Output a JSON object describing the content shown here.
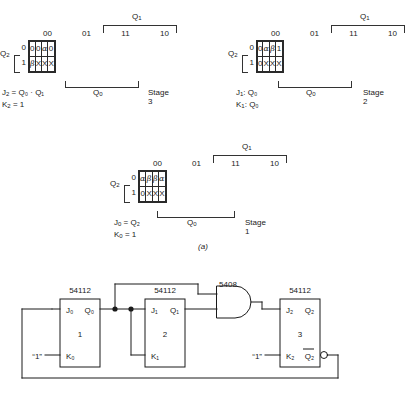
{
  "figure": {
    "caption": "(a)"
  },
  "kmaps": [
    {
      "id": "stage3",
      "top_var": "Q",
      "top_var_sub": "1",
      "side_var": "Q",
      "side_var_sub": "2",
      "col_headers": [
        "00",
        "01",
        "11",
        "10"
      ],
      "row_headers": [
        "0",
        "1"
      ],
      "rows": [
        [
          "0",
          "0",
          "α",
          "0"
        ],
        [
          "β",
          "X",
          "X",
          "X"
        ]
      ],
      "group_label": "Q",
      "group_label_sub": "0",
      "stage": "Stage 3",
      "equations": [
        {
          "lhs": "J",
          "lhs_sub": "2",
          "rhs": "= Q₀ · Q₁"
        },
        {
          "lhs": "K",
          "lhs_sub": "2",
          "rhs": "= 1"
        }
      ]
    },
    {
      "id": "stage2",
      "top_var": "Q",
      "top_var_sub": "1",
      "side_var": "Q",
      "side_var_sub": "2",
      "col_headers": [
        "00",
        "01",
        "11",
        "10"
      ],
      "row_headers": [
        "0",
        "1"
      ],
      "rows": [
        [
          "0",
          "α",
          "β",
          "1"
        ],
        [
          "0",
          "X",
          "X",
          "X"
        ]
      ],
      "group_label": "Q",
      "group_label_sub": "0",
      "stage": "Stage 2",
      "equations": [
        {
          "lhs": "J",
          "lhs_sub": "1",
          "rhs": ": Q₀"
        },
        {
          "lhs": "K",
          "lhs_sub": "1",
          "rhs": ": Q₀"
        }
      ]
    },
    {
      "id": "stage1",
      "top_var": "Q",
      "top_var_sub": "1",
      "side_var": "Q",
      "side_var_sub": "2",
      "col_headers": [
        "00",
        "01",
        "11",
        "10"
      ],
      "row_headers": [
        "0",
        "1"
      ],
      "rows": [
        [
          "α",
          "β",
          "β",
          "α"
        ],
        [
          "0",
          "X",
          "X",
          "X"
        ]
      ],
      "group_label": "Q",
      "group_label_sub": "0",
      "stage": "Stage 1",
      "equations": [
        {
          "lhs": "J",
          "lhs_sub": "0",
          "rhs": "= Q₂"
        },
        {
          "lhs": "K",
          "lhs_sub": "0",
          "rhs": "= 1"
        }
      ]
    }
  ],
  "circuit": {
    "gate": {
      "type": "5408",
      "label": "5408"
    },
    "flipflops": [
      {
        "part": "54112",
        "number": "1",
        "j_label": "J₀",
        "k_label": "K₀",
        "q_label": "Q₀",
        "qbar_label": ""
      },
      {
        "part": "54112",
        "number": "2",
        "j_label": "J₁",
        "k_label": "K₁",
        "q_label": "Q₁",
        "qbar_label": ""
      },
      {
        "part": "54112",
        "number": "3",
        "j_label": "J₂",
        "k_label": "K₂",
        "q_label": "Q₂",
        "qbar_label": "Q₂"
      }
    ],
    "inputs": [
      {
        "label": "“1”"
      },
      {
        "label": "“1”"
      }
    ]
  }
}
